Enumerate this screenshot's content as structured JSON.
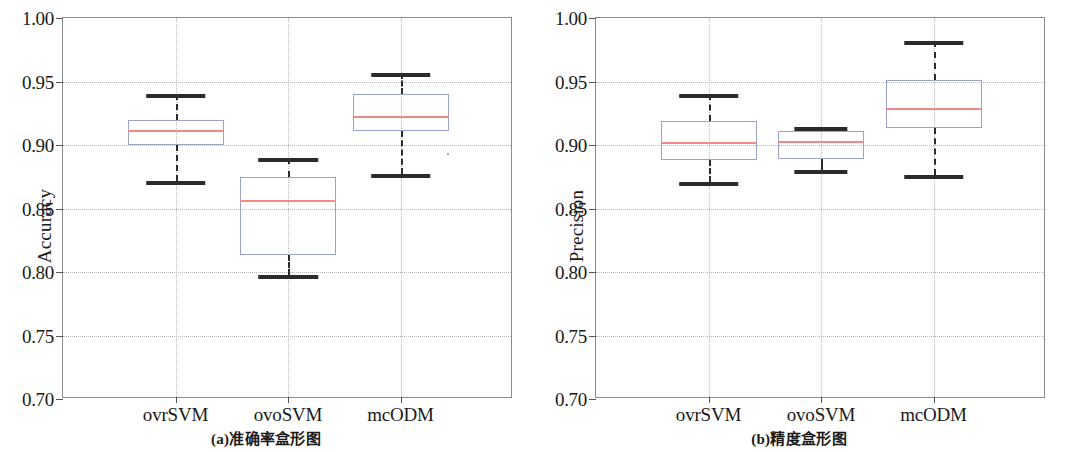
{
  "figure": {
    "axis_min": 0.7,
    "axis_max": 1.0,
    "y_ticks": [
      "1.00",
      "0.95",
      "0.90",
      "0.85",
      "0.80",
      "0.75",
      "0.70"
    ],
    "y_tick_values": [
      1.0,
      0.95,
      0.9,
      0.85,
      0.8,
      0.75,
      0.7
    ],
    "categories": [
      "ovrSVM",
      "ovoSVM",
      "mcODM"
    ],
    "box_edge_color": "#9aa3c8",
    "median_color": "#ef8a86",
    "whisker_color": "#2b2b2b",
    "grid_color": "#b9b9b9",
    "axis_color": "#8c8c8c"
  },
  "panels": [
    {
      "id": "panel-a",
      "caption": "(a)准确率盒形图",
      "ylabel": "Accuracy"
    },
    {
      "id": "panel-b",
      "caption": "(b)精度盒形图",
      "ylabel": "Precision"
    }
  ],
  "chart_data": [
    {
      "type": "box",
      "title": "(a)准确率盒形图",
      "xlabel": "",
      "ylabel": "Accuracy",
      "ylim": [
        0.7,
        1.0
      ],
      "yticks": [
        0.7,
        0.75,
        0.8,
        0.85,
        0.9,
        0.95,
        1.0
      ],
      "grid": true,
      "legend": "none",
      "categories": [
        "ovrSVM",
        "ovoSVM",
        "mcODM"
      ],
      "boxes": [
        {
          "label": "ovrSVM",
          "whisker_low": 0.872,
          "q1": 0.9,
          "median": 0.912,
          "q3": 0.92,
          "whisker_high": 0.94,
          "outliers": []
        },
        {
          "label": "ovoSVM",
          "whisker_low": 0.798,
          "q1": 0.813,
          "median": 0.857,
          "q3": 0.875,
          "whisker_high": 0.89,
          "outliers": []
        },
        {
          "label": "mcODM",
          "whisker_low": 0.877,
          "q1": 0.911,
          "median": 0.923,
          "q3": 0.94,
          "whisker_high": 0.957,
          "outliers": [
            0.894
          ]
        }
      ]
    },
    {
      "type": "box",
      "title": "(b)精度盒形图",
      "xlabel": "",
      "ylabel": "Precision",
      "ylim": [
        0.7,
        1.0
      ],
      "yticks": [
        0.7,
        0.75,
        0.8,
        0.85,
        0.9,
        0.95,
        1.0
      ],
      "grid": true,
      "legend": "none",
      "categories": [
        "ovrSVM",
        "ovoSVM",
        "mcODM"
      ],
      "boxes": [
        {
          "label": "ovrSVM",
          "whisker_low": 0.871,
          "q1": 0.888,
          "median": 0.902,
          "q3": 0.919,
          "whisker_high": 0.94,
          "outliers": []
        },
        {
          "label": "ovoSVM",
          "whisker_low": 0.88,
          "q1": 0.889,
          "median": 0.903,
          "q3": 0.911,
          "whisker_high": 0.914,
          "outliers": []
        },
        {
          "label": "mcODM",
          "whisker_low": 0.876,
          "q1": 0.913,
          "median": 0.929,
          "q3": 0.951,
          "whisker_high": 0.982,
          "outliers": []
        }
      ]
    }
  ]
}
